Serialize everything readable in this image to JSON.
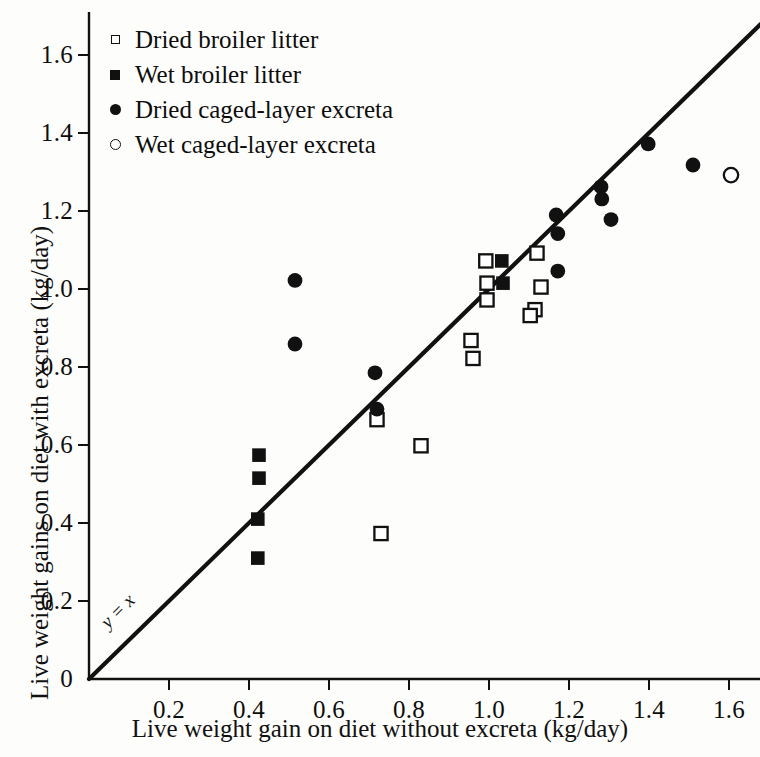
{
  "chart_data": {
    "type": "scatter",
    "title": "",
    "xlabel": "Live weight gain on diet without excreta (kg/day)",
    "ylabel": "Live weight gains on diet with excreta (kg/day)",
    "xlim": [
      0,
      1.7
    ],
    "ylim": [
      0,
      1.7
    ],
    "xticks": [
      "0.2",
      "0.4",
      "0.6",
      "0.8",
      "1.0",
      "1.2",
      "1.4",
      "1.6"
    ],
    "xtick_values": [
      0.2,
      0.4,
      0.6,
      0.8,
      1.0,
      1.2,
      1.4,
      1.6
    ],
    "yticks": [
      "0",
      "0.2",
      "0.4",
      "0.6",
      "0.8",
      "1.0",
      "1.2",
      "1.4",
      "1.6"
    ],
    "ytick_values": [
      0,
      0.2,
      0.4,
      0.6,
      0.8,
      1.0,
      1.2,
      1.4,
      1.6
    ],
    "grid": false,
    "legend_position": "top-left",
    "reference_line": {
      "label": "y = x",
      "slope": 1,
      "intercept": 0,
      "from": [
        0,
        0
      ],
      "to": [
        1.68,
        1.68
      ]
    },
    "series": [
      {
        "name": "Dried broiler litter",
        "marker": "open-square",
        "points": [
          [
            0.72,
            0.665
          ],
          [
            0.83,
            0.598
          ],
          [
            0.73,
            0.373
          ],
          [
            0.955,
            0.868
          ],
          [
            0.96,
            0.822
          ],
          [
            0.992,
            1.072
          ],
          [
            0.995,
            1.015
          ],
          [
            0.995,
            0.972
          ],
          [
            1.12,
            1.092
          ],
          [
            1.13,
            1.005
          ],
          [
            1.115,
            0.947
          ],
          [
            1.103,
            0.932
          ]
        ]
      },
      {
        "name": "Wet broiler litter",
        "marker": "filled-square",
        "points": [
          [
            0.425,
            0.574
          ],
          [
            0.425,
            0.515
          ],
          [
            0.422,
            0.41
          ],
          [
            0.422,
            0.31
          ],
          [
            1.032,
            1.072
          ],
          [
            1.035,
            1.015
          ]
        ]
      },
      {
        "name": "Dried caged-layer excreta",
        "marker": "filled-circle",
        "points": [
          [
            0.515,
            1.022
          ],
          [
            0.515,
            0.859
          ],
          [
            0.715,
            0.785
          ],
          [
            0.72,
            0.692
          ],
          [
            1.172,
            1.046
          ],
          [
            1.168,
            1.19
          ],
          [
            1.172,
            1.142
          ],
          [
            1.28,
            1.262
          ],
          [
            1.282,
            1.231
          ],
          [
            1.305,
            1.178
          ],
          [
            1.398,
            1.372
          ],
          [
            1.51,
            1.318
          ]
        ]
      },
      {
        "name": "Wet caged-layer excreta",
        "marker": "open-circle",
        "points": [
          [
            1.605,
            1.292
          ]
        ]
      }
    ]
  },
  "legend": {
    "items": [
      {
        "label": "Dried broiler litter",
        "marker": "open-square"
      },
      {
        "label": "Wet broiler litter",
        "marker": "filled-square"
      },
      {
        "label": "Dried caged-layer excreta",
        "marker": "filled-circle"
      },
      {
        "label": "Wet caged-layer excreta",
        "marker": "open-circle"
      }
    ]
  },
  "axes": {
    "x_title": "Live weight gain on diet without excreta (kg/day)",
    "y_title": "Live weight gains on diet with excreta (kg/day)",
    "origin_label": "0"
  },
  "colors": {
    "ink": "#111111",
    "background": "#fdfdfb"
  }
}
